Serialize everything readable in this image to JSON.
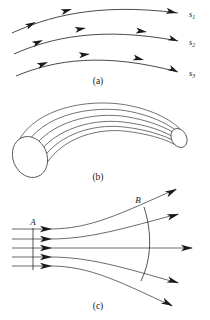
{
  "figure": {
    "background_color": "#ffffff",
    "ink_color": "#1a1a1a",
    "width": 210,
    "height": 320
  },
  "panels": [
    {
      "id": "a",
      "caption": "(a)",
      "caption_x": 98,
      "caption_y": 84,
      "description": "Three curved streamlines with directional arrowheads",
      "stream_labels": [
        {
          "base": "s",
          "sub": "1",
          "x": 190,
          "y": 15
        },
        {
          "base": "s",
          "sub": "2",
          "x": 190,
          "y": 42
        },
        {
          "base": "s",
          "sub": "3",
          "x": 190,
          "y": 73
        }
      ],
      "curves": [
        {
          "name": "streamline-s1",
          "path": "M 12,33 C 45,18 95,2 178,13",
          "arrows": [
            {
              "x": 36,
              "y": 22,
              "angle": -26
            },
            {
              "x": 72,
              "y": 9,
              "angle": -16
            },
            {
              "x": 176,
              "y": 12,
              "angle": 12
            }
          ]
        },
        {
          "name": "streamline-s2",
          "path": "M 14,54 C 50,38 100,26 178,41",
          "arrows": [
            {
              "x": 43,
              "y": 40,
              "angle": -24
            },
            {
              "x": 86,
              "y": 28,
              "angle": -10
            },
            {
              "x": 147,
              "y": 32,
              "angle": 8
            },
            {
              "x": 176,
              "y": 40,
              "angle": 18
            }
          ]
        },
        {
          "name": "streamline-s3",
          "path": "M 16,76 C 54,60 104,52 178,72",
          "arrows": [
            {
              "x": 48,
              "y": 62,
              "angle": -22
            },
            {
              "x": 90,
              "y": 54,
              "angle": -6
            },
            {
              "x": 144,
              "y": 60,
              "angle": 14
            },
            {
              "x": 176,
              "y": 71,
              "angle": 24
            }
          ]
        }
      ]
    },
    {
      "id": "b",
      "caption": "(b)",
      "caption_x": 98,
      "caption_y": 180,
      "description": "Curved stream tube drawn in perspective with elliptical end caps and internal streamlines",
      "tube": {
        "left_cap": {
          "cx": 30,
          "cy": 157,
          "rx": 17,
          "ry": 21,
          "rotate": -22
        },
        "right_cap": {
          "cx": 179,
          "cy": 137,
          "rx": 7.5,
          "ry": 10,
          "rotate": -28
        },
        "internal_line_count": 5
      }
    },
    {
      "id": "c",
      "caption": "(c)",
      "caption_x": 98,
      "caption_y": 309,
      "description": "Flow converging through cross-section A then diverging through cross-section B",
      "section_labels": [
        {
          "text": "A",
          "x": 33,
          "y": 225
        },
        {
          "text": "B",
          "x": 138,
          "y": 203
        }
      ],
      "section_marks": [
        {
          "name": "section-a-line",
          "path": "M 33,228 L 33,270"
        },
        {
          "name": "section-b-arc",
          "path": "M 144,207 C 152,232 152,258 141,281"
        }
      ],
      "throat_x": 52,
      "flowlines": [
        {
          "name": "flowline-top",
          "path": "M 12,229 L 50,229 C 90,229 120,214 176,189"
        },
        {
          "name": "flowline-upper-mid",
          "path": "M 12,239 L 50,239 C 90,239 125,228 178,214"
        },
        {
          "name": "flowline-center",
          "path": "M 12,248 L 192,248"
        },
        {
          "name": "flowline-lower-mid",
          "path": "M 12,257 L 50,257 C 90,257 125,268 178,283"
        },
        {
          "name": "flowline-bottom",
          "path": "M 12,266 L 50,266 C 90,266 120,282 172,306"
        }
      ],
      "throat_arrows": [
        {
          "x": 50,
          "y": 229,
          "angle": 0
        },
        {
          "x": 50,
          "y": 239,
          "angle": 0
        },
        {
          "x": 50,
          "y": 248,
          "angle": 0
        },
        {
          "x": 50,
          "y": 257,
          "angle": 0
        },
        {
          "x": 50,
          "y": 266,
          "angle": 0
        }
      ],
      "exit_arrows": [
        {
          "x": 176,
          "y": 189,
          "angle": -26
        },
        {
          "x": 178,
          "y": 214,
          "angle": -16
        },
        {
          "x": 192,
          "y": 248,
          "angle": 0
        },
        {
          "x": 178,
          "y": 283,
          "angle": 17
        },
        {
          "x": 172,
          "y": 306,
          "angle": 27
        }
      ]
    }
  ]
}
